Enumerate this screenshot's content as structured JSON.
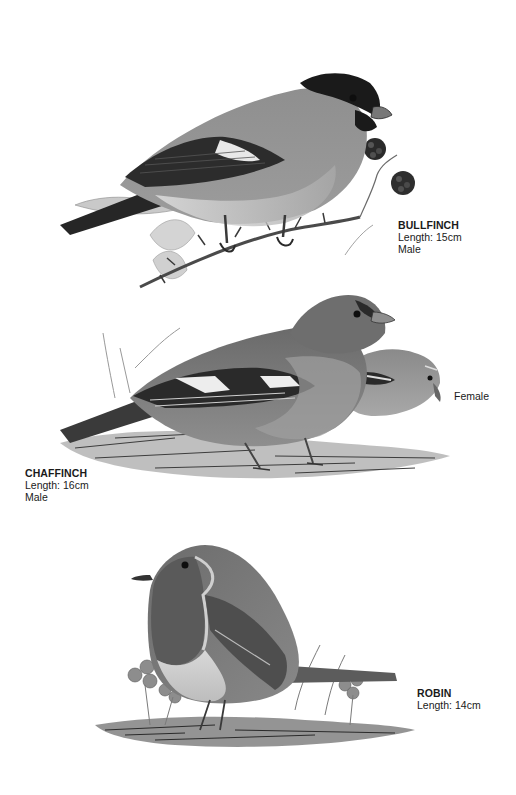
{
  "page": {
    "background": "#ffffff",
    "ink_dark": "#1c1c1c",
    "ink_mid": "#7a7a7a",
    "ink_light": "#b8b8b8"
  },
  "birds": [
    {
      "id": "bullfinch",
      "name": "BULLFINCH",
      "length": "Length: 15cm",
      "sex": "Male",
      "illustration": "bullfinch-on-bramble"
    },
    {
      "id": "chaffinch",
      "name": "CHAFFINCH",
      "length": "Length: 16cm",
      "sex": "Male",
      "secondary_label": "Female",
      "illustration": "chaffinch-pair-on-ground"
    },
    {
      "id": "robin",
      "name": "ROBIN",
      "length": "Length: 14cm",
      "illustration": "robin-on-ground-with-clover"
    }
  ]
}
